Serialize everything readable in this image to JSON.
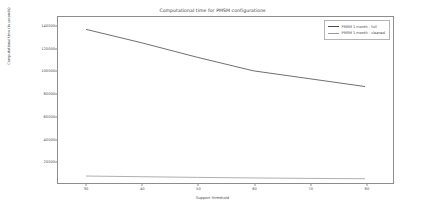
{
  "chart_data": {
    "type": "line",
    "title": "Computational time for PMSM configurations",
    "xlabel": "Support threshold",
    "ylabel": "Computational time (in seconds)",
    "xlim": [
      25,
      85
    ],
    "ylim": [
      0,
      148000
    ],
    "xticks": [
      30,
      40,
      50,
      60,
      70,
      80
    ],
    "yticks": [
      20000,
      40000,
      60000,
      80000,
      100000,
      120000,
      140000
    ],
    "grid": false,
    "legend_position": "upper right",
    "x": [
      30,
      40,
      50,
      60,
      70,
      80
    ],
    "series": [
      {
        "name": "PMSM 1 month - full",
        "color": "#4a4a4a",
        "values": [
          137000,
          125000,
          112000,
          100000,
          93000,
          86000
        ]
      },
      {
        "name": "PMSM 1 month - cleaned",
        "color": "#9a9a9a",
        "values": [
          6200,
          5600,
          5000,
          4500,
          4100,
          3800
        ]
      }
    ]
  },
  "legend": {
    "items": [
      {
        "label": "PMSM 1 month - full"
      },
      {
        "label": "PMSM 1 month - cleaned"
      }
    ]
  },
  "ticks": {
    "y": [
      "140000",
      "120000",
      "100000",
      "80000",
      "60000",
      "40000",
      "20000"
    ],
    "x": [
      "30",
      "40",
      "50",
      "60",
      "70",
      "80"
    ]
  }
}
